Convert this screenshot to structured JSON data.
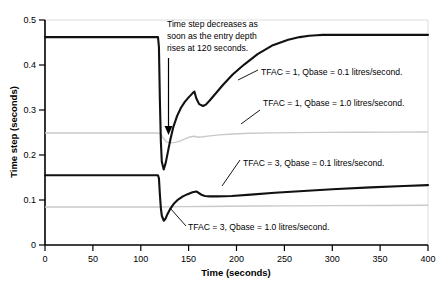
{
  "chart_data": {
    "type": "line",
    "title": "",
    "xlabel": "Time (seconds)",
    "ylabel": "Time step (seconds)",
    "xlim": [
      0,
      400
    ],
    "ylim": [
      0,
      0.5
    ],
    "xticks": [
      "0",
      "50",
      "100",
      "150",
      "200",
      "250",
      "300",
      "350",
      "400"
    ],
    "xtick_values": [
      0,
      50,
      100,
      150,
      200,
      250,
      300,
      350,
      400
    ],
    "yticks": [
      "0",
      "0.1",
      "0.2",
      "0.3",
      "0.4",
      "0.5"
    ],
    "ytick_values": [
      0,
      0.1,
      0.2,
      0.3,
      0.4,
      0.5
    ],
    "grid": "horizontal-light",
    "legend": "inline-annotations",
    "colors": {
      "series_dark": "#111111",
      "series_light": "#c9c9c9",
      "axis": "#000000",
      "gridline": "#e2e2e2",
      "background": "#ffffff"
    },
    "series": [
      {
        "name": "TFAC = 1, Qbase  = 0.1 litres/second.",
        "color": "#111111",
        "style": "dark",
        "x": [
          0,
          118,
          119,
          120,
          121,
          122,
          124,
          126,
          128,
          131,
          134,
          138,
          142,
          146,
          150,
          154,
          156,
          158,
          161,
          165,
          168,
          172,
          178,
          186,
          196,
          208,
          222,
          238,
          254,
          266,
          276,
          284,
          290,
          300,
          330,
          360,
          400
        ],
        "y": [
          0.462,
          0.462,
          0.44,
          0.32,
          0.23,
          0.185,
          0.168,
          0.182,
          0.203,
          0.235,
          0.262,
          0.287,
          0.305,
          0.318,
          0.328,
          0.337,
          0.341,
          0.326,
          0.313,
          0.309,
          0.312,
          0.321,
          0.336,
          0.356,
          0.379,
          0.401,
          0.424,
          0.444,
          0.456,
          0.462,
          0.465,
          0.466,
          0.467,
          0.467,
          0.467,
          0.467,
          0.467
        ]
      },
      {
        "name": "TFAC = 1, Qbase  = 1.0 litres/second.",
        "color": "#c9c9c9",
        "style": "light",
        "x": [
          0,
          110,
          118,
          121,
          124,
          127,
          131,
          136,
          141,
          146,
          151,
          156,
          160,
          165,
          172,
          182,
          196,
          214,
          236,
          262,
          292,
          330,
          365,
          400
        ],
        "y": [
          0.249,
          0.249,
          0.249,
          0.247,
          0.236,
          0.229,
          0.227,
          0.228,
          0.231,
          0.236,
          0.24,
          0.2415,
          0.2395,
          0.2405,
          0.2425,
          0.2448,
          0.2465,
          0.2482,
          0.2492,
          0.2498,
          0.2502,
          0.2506,
          0.2508,
          0.251
        ]
      },
      {
        "name": "TFAC = 3, Qbase  = 0.1 litres/second.",
        "color": "#111111",
        "style": "dark",
        "x": [
          0,
          118,
          119,
          120,
          121,
          122,
          124,
          126,
          128,
          131,
          135,
          139,
          144,
          149,
          154,
          158,
          161,
          164,
          167,
          172,
          180,
          195,
          215,
          240,
          270,
          300,
          340,
          375,
          400
        ],
        "y": [
          0.155,
          0.155,
          0.148,
          0.112,
          0.082,
          0.065,
          0.054,
          0.059,
          0.069,
          0.081,
          0.093,
          0.101,
          0.108,
          0.113,
          0.117,
          0.119,
          0.115,
          0.111,
          0.109,
          0.108,
          0.108,
          0.109,
          0.112,
          0.116,
          0.12,
          0.124,
          0.128,
          0.131,
          0.133
        ]
      },
      {
        "name": "TFAC = 3, Qbase  = 1.0 litres/second.",
        "color": "#c9c9c9",
        "style": "light",
        "x": [
          0,
          110,
          120,
          130,
          145,
          165,
          190,
          220,
          260,
          300,
          350,
          400
        ],
        "y": [
          0.0845,
          0.0845,
          0.0845,
          0.0848,
          0.0852,
          0.0857,
          0.0862,
          0.0866,
          0.087,
          0.0874,
          0.0878,
          0.0882
        ]
      }
    ],
    "annotations": [
      {
        "id": "annotation-main",
        "lines": [
          "Time step decreases as",
          "soon as the entry depth",
          "rises at 120 seconds."
        ],
        "arrow": "down-arrow-to-120s"
      }
    ],
    "series_labels": [
      {
        "id": "label-tfac1-q01",
        "text": "TFAC = 1, Qbase  = 0.1 litres/second."
      },
      {
        "id": "label-tfac1-q10",
        "text": "TFAC = 1, Qbase  = 1.0 litres/second."
      },
      {
        "id": "label-tfac3-q01",
        "text": "TFAC = 3, Qbase  = 0.1 litres/second."
      },
      {
        "id": "label-tfac3-q10",
        "text": "TFAC = 3, Qbase  = 1.0 litres/second."
      }
    ]
  }
}
